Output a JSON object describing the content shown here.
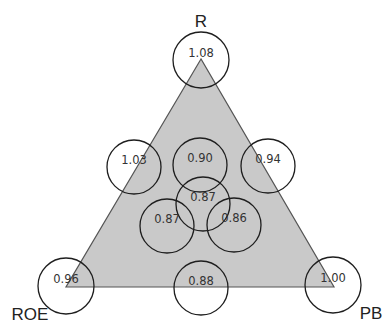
{
  "diagram": {
    "colors": {
      "triangle_fill": "#c9c9c9",
      "triangle_stroke": "#555555",
      "circle_stroke": "#1e1e1e",
      "text": "#333333",
      "background": "#ffffff"
    },
    "triangle": {
      "vertices": [
        {
          "name": "R",
          "x": 201,
          "y": 59
        },
        {
          "name": "ROE",
          "x": 66,
          "y": 287
        },
        {
          "name": "PB",
          "x": 334,
          "y": 287
        }
      ]
    },
    "vertex_labels": {
      "top": "R",
      "bottom_left": "ROE",
      "bottom_right": "PB"
    },
    "nodes": [
      {
        "id": "apex-r",
        "value": "1.08",
        "cx": 201,
        "cy": 60,
        "r": 28
      },
      {
        "id": "left-edge-mid",
        "value": "1.03",
        "cx": 134,
        "cy": 167,
        "r": 27
      },
      {
        "id": "upper-center",
        "value": "0.90",
        "cx": 200,
        "cy": 165,
        "r": 27
      },
      {
        "id": "right-edge-mid",
        "value": "0.94",
        "cx": 268,
        "cy": 166,
        "r": 27
      },
      {
        "id": "center",
        "value": "0.87",
        "cx": 203,
        "cy": 204,
        "r": 27
      },
      {
        "id": "lower-left-inner",
        "value": "0.87",
        "cx": 167,
        "cy": 226,
        "r": 27
      },
      {
        "id": "lower-right-inner",
        "value": "0.86",
        "cx": 234,
        "cy": 225,
        "r": 27
      },
      {
        "id": "vertex-roe",
        "value": "0.96",
        "cx": 66,
        "cy": 286,
        "r": 28
      },
      {
        "id": "bottom-edge-mid",
        "value": "0.88",
        "cx": 201,
        "cy": 288,
        "r": 27
      },
      {
        "id": "vertex-pb",
        "value": "1.00",
        "cx": 333,
        "cy": 285,
        "r": 28
      }
    ]
  }
}
